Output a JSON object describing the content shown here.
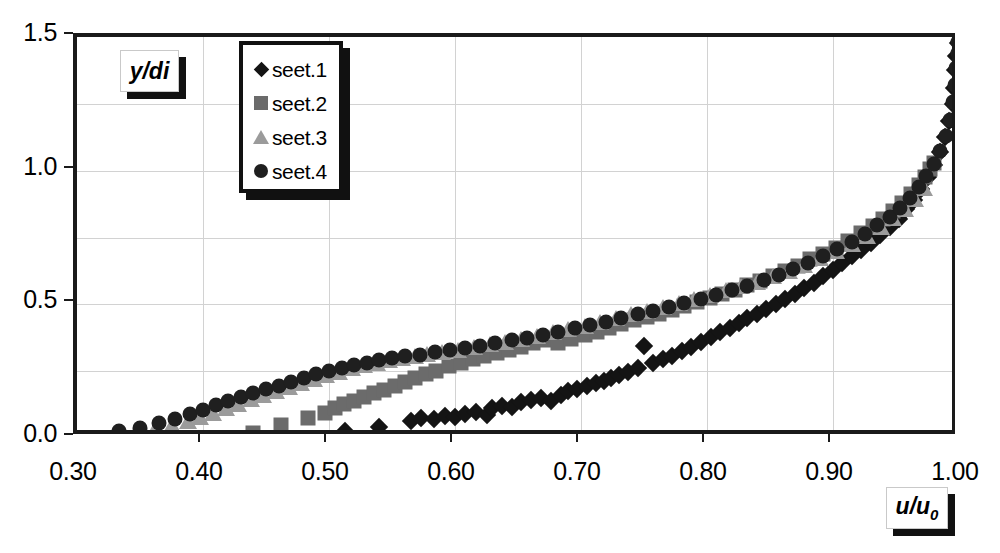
{
  "chart_data": {
    "type": "scatter",
    "title": "",
    "xlabel": "u/u0",
    "ylabel": "y/di",
    "xlim": [
      0.3,
      1.0
    ],
    "ylim": [
      0.0,
      1.5
    ],
    "xticks": [
      "0.30",
      "0.40",
      "0.50",
      "0.60",
      "0.70",
      "0.80",
      "0.90",
      "1.00"
    ],
    "xtick_values": [
      0.3,
      0.4,
      0.5,
      0.6,
      0.7,
      0.8,
      0.9,
      1.0
    ],
    "yticks": [
      "0.0",
      "0.5",
      "1.0",
      "1.5"
    ],
    "ytick_values": [
      0.0,
      0.5,
      1.0,
      1.5
    ],
    "y_minor_gridlines": [
      0.25,
      0.75,
      1.25
    ],
    "grid": true,
    "legend_position": "top-left-inside",
    "series": [
      {
        "name": "seet.1",
        "marker": "diamond",
        "color": "#141414",
        "points": [
          [
            0.513,
            0.025
          ],
          [
            0.54,
            0.04
          ],
          [
            0.565,
            0.065
          ],
          [
            0.573,
            0.073
          ],
          [
            0.583,
            0.07
          ],
          [
            0.592,
            0.082
          ],
          [
            0.6,
            0.078
          ],
          [
            0.608,
            0.09
          ],
          [
            0.617,
            0.098
          ],
          [
            0.625,
            0.085
          ],
          [
            0.629,
            0.112
          ],
          [
            0.637,
            0.12
          ],
          [
            0.645,
            0.115
          ],
          [
            0.652,
            0.133
          ],
          [
            0.66,
            0.142
          ],
          [
            0.668,
            0.15
          ],
          [
            0.676,
            0.14
          ],
          [
            0.684,
            0.162
          ],
          [
            0.69,
            0.175
          ],
          [
            0.697,
            0.185
          ],
          [
            0.705,
            0.195
          ],
          [
            0.712,
            0.205
          ],
          [
            0.718,
            0.215
          ],
          [
            0.724,
            0.225
          ],
          [
            0.73,
            0.235
          ],
          [
            0.737,
            0.248
          ],
          [
            0.745,
            0.262
          ],
          [
            0.75,
            0.345
          ],
          [
            0.757,
            0.28
          ],
          [
            0.765,
            0.295
          ],
          [
            0.772,
            0.308
          ],
          [
            0.78,
            0.325
          ],
          [
            0.787,
            0.34
          ],
          [
            0.795,
            0.36
          ],
          [
            0.803,
            0.378
          ],
          [
            0.81,
            0.395
          ],
          [
            0.818,
            0.412
          ],
          [
            0.825,
            0.43
          ],
          [
            0.832,
            0.448
          ],
          [
            0.84,
            0.465
          ],
          [
            0.847,
            0.483
          ],
          [
            0.855,
            0.5
          ],
          [
            0.862,
            0.52
          ],
          [
            0.87,
            0.54
          ],
          [
            0.877,
            0.56
          ],
          [
            0.885,
            0.58
          ],
          [
            0.892,
            0.605
          ],
          [
            0.9,
            0.63
          ],
          [
            0.907,
            0.655
          ],
          [
            0.915,
            0.68
          ],
          [
            0.922,
            0.705
          ],
          [
            0.93,
            0.73
          ],
          [
            0.937,
            0.76
          ],
          [
            0.945,
            0.79
          ],
          [
            0.952,
            0.82
          ],
          [
            0.958,
            0.855
          ],
          [
            0.964,
            0.89
          ],
          [
            0.97,
            0.93
          ],
          [
            0.975,
            0.975
          ],
          [
            0.98,
            1.02
          ],
          [
            0.985,
            1.07
          ],
          [
            0.989,
            1.125
          ],
          [
            0.992,
            1.185
          ],
          [
            0.995,
            1.25
          ],
          [
            0.996,
            1.31
          ],
          [
            0.997,
            1.375
          ],
          [
            0.998,
            1.43
          ],
          [
            0.999,
            1.478
          ]
        ]
      },
      {
        "name": "seet.2",
        "marker": "square",
        "color": "#6b6b6b",
        "points": [
          [
            0.44,
            0.02
          ],
          [
            0.462,
            0.048
          ],
          [
            0.483,
            0.075
          ],
          [
            0.497,
            0.095
          ],
          [
            0.505,
            0.112
          ],
          [
            0.512,
            0.128
          ],
          [
            0.52,
            0.14
          ],
          [
            0.528,
            0.155
          ],
          [
            0.536,
            0.168
          ],
          [
            0.544,
            0.18
          ],
          [
            0.552,
            0.195
          ],
          [
            0.56,
            0.21
          ],
          [
            0.568,
            0.225
          ],
          [
            0.577,
            0.24
          ],
          [
            0.585,
            0.252
          ],
          [
            0.595,
            0.268
          ],
          [
            0.605,
            0.282
          ],
          [
            0.614,
            0.295
          ],
          [
            0.623,
            0.305
          ],
          [
            0.633,
            0.318
          ],
          [
            0.643,
            0.33
          ],
          [
            0.652,
            0.342
          ],
          [
            0.662,
            0.355
          ],
          [
            0.672,
            0.368
          ],
          [
            0.682,
            0.355
          ],
          [
            0.692,
            0.372
          ],
          [
            0.703,
            0.385
          ],
          [
            0.713,
            0.398
          ],
          [
            0.722,
            0.412
          ],
          [
            0.732,
            0.425
          ],
          [
            0.742,
            0.44
          ],
          [
            0.752,
            0.452
          ],
          [
            0.762,
            0.465
          ],
          [
            0.772,
            0.48
          ],
          [
            0.782,
            0.495
          ],
          [
            0.792,
            0.51
          ],
          [
            0.802,
            0.525
          ],
          [
            0.812,
            0.54
          ],
          [
            0.822,
            0.555
          ],
          [
            0.832,
            0.572
          ],
          [
            0.842,
            0.588
          ],
          [
            0.852,
            0.605
          ],
          [
            0.862,
            0.625
          ],
          [
            0.872,
            0.645
          ],
          [
            0.882,
            0.668
          ],
          [
            0.892,
            0.69
          ],
          [
            0.902,
            0.712
          ],
          [
            0.912,
            0.738
          ],
          [
            0.922,
            0.765
          ],
          [
            0.932,
            0.792
          ],
          [
            0.94,
            0.82
          ],
          [
            0.948,
            0.85
          ],
          [
            0.955,
            0.88
          ],
          [
            0.962,
            0.912
          ],
          [
            0.968,
            0.945
          ],
          [
            0.973,
            0.978
          ],
          [
            0.977,
            1.005
          ],
          [
            0.98,
            1.03
          ]
        ]
      },
      {
        "name": "seet.3",
        "marker": "triangle",
        "color": "#9b9b9b",
        "points": [
          [
            0.348,
            0.022
          ],
          [
            0.362,
            0.035
          ],
          [
            0.375,
            0.048
          ],
          [
            0.388,
            0.062
          ],
          [
            0.398,
            0.078
          ],
          [
            0.408,
            0.095
          ],
          [
            0.418,
            0.112
          ],
          [
            0.428,
            0.128
          ],
          [
            0.438,
            0.145
          ],
          [
            0.448,
            0.16
          ],
          [
            0.458,
            0.175
          ],
          [
            0.468,
            0.19
          ],
          [
            0.478,
            0.205
          ],
          [
            0.488,
            0.22
          ],
          [
            0.498,
            0.235
          ],
          [
            0.508,
            0.248
          ],
          [
            0.518,
            0.262
          ],
          [
            0.528,
            0.272
          ],
          [
            0.538,
            0.282
          ],
          [
            0.548,
            0.292
          ],
          [
            0.558,
            0.3
          ],
          [
            0.568,
            0.308
          ],
          [
            0.578,
            0.315
          ],
          [
            0.59,
            0.322
          ],
          [
            0.602,
            0.33
          ],
          [
            0.615,
            0.34
          ],
          [
            0.628,
            0.35
          ],
          [
            0.64,
            0.36
          ],
          [
            0.652,
            0.37
          ],
          [
            0.665,
            0.382
          ],
          [
            0.678,
            0.395
          ],
          [
            0.69,
            0.408
          ],
          [
            0.703,
            0.42
          ],
          [
            0.715,
            0.435
          ],
          [
            0.728,
            0.448
          ],
          [
            0.74,
            0.462
          ],
          [
            0.752,
            0.475
          ],
          [
            0.765,
            0.49
          ],
          [
            0.778,
            0.505
          ],
          [
            0.79,
            0.52
          ],
          [
            0.802,
            0.535
          ],
          [
            0.815,
            0.552
          ],
          [
            0.827,
            0.568
          ],
          [
            0.84,
            0.585
          ],
          [
            0.852,
            0.605
          ],
          [
            0.865,
            0.625
          ],
          [
            0.877,
            0.648
          ],
          [
            0.89,
            0.672
          ],
          [
            0.902,
            0.698
          ],
          [
            0.915,
            0.725
          ],
          [
            0.927,
            0.755
          ],
          [
            0.938,
            0.788
          ],
          [
            0.948,
            0.822
          ],
          [
            0.957,
            0.858
          ],
          [
            0.965,
            0.895
          ],
          [
            0.972,
            0.935
          ]
        ]
      },
      {
        "name": "seet.4",
        "marker": "circle",
        "color": "#1f1f1f",
        "points": [
          [
            0.333,
            0.025
          ],
          [
            0.35,
            0.038
          ],
          [
            0.365,
            0.055
          ],
          [
            0.378,
            0.072
          ],
          [
            0.39,
            0.09
          ],
          [
            0.4,
            0.105
          ],
          [
            0.41,
            0.122
          ],
          [
            0.42,
            0.138
          ],
          [
            0.43,
            0.152
          ],
          [
            0.44,
            0.168
          ],
          [
            0.45,
            0.182
          ],
          [
            0.46,
            0.196
          ],
          [
            0.47,
            0.21
          ],
          [
            0.48,
            0.224
          ],
          [
            0.49,
            0.238
          ],
          [
            0.5,
            0.25
          ],
          [
            0.51,
            0.262
          ],
          [
            0.52,
            0.272
          ],
          [
            0.53,
            0.282
          ],
          [
            0.54,
            0.29
          ],
          [
            0.55,
            0.298
          ],
          [
            0.56,
            0.305
          ],
          [
            0.572,
            0.312
          ],
          [
            0.584,
            0.32
          ],
          [
            0.596,
            0.328
          ],
          [
            0.608,
            0.336
          ],
          [
            0.62,
            0.345
          ],
          [
            0.632,
            0.355
          ],
          [
            0.645,
            0.365
          ],
          [
            0.657,
            0.375
          ],
          [
            0.67,
            0.387
          ],
          [
            0.682,
            0.398
          ],
          [
            0.695,
            0.41
          ],
          [
            0.707,
            0.422
          ],
          [
            0.72,
            0.435
          ],
          [
            0.732,
            0.448
          ],
          [
            0.745,
            0.462
          ],
          [
            0.757,
            0.476
          ],
          [
            0.77,
            0.49
          ],
          [
            0.782,
            0.505
          ],
          [
            0.795,
            0.52
          ],
          [
            0.807,
            0.536
          ],
          [
            0.82,
            0.552
          ],
          [
            0.832,
            0.57
          ],
          [
            0.845,
            0.59
          ],
          [
            0.857,
            0.61
          ],
          [
            0.868,
            0.632
          ],
          [
            0.88,
            0.655
          ],
          [
            0.892,
            0.68
          ],
          [
            0.903,
            0.706
          ],
          [
            0.915,
            0.734
          ],
          [
            0.925,
            0.764
          ],
          [
            0.935,
            0.795
          ],
          [
            0.945,
            0.828
          ],
          [
            0.953,
            0.862
          ],
          [
            0.961,
            0.898
          ],
          [
            0.968,
            0.938
          ],
          [
            0.974,
            0.98
          ],
          [
            0.98,
            1.025
          ],
          [
            0.985,
            1.075
          ],
          [
            0.99,
            1.13
          ],
          [
            0.993,
            1.19
          ],
          [
            0.995,
            1.255
          ],
          [
            0.997,
            1.32
          ],
          [
            0.998,
            1.385
          ],
          [
            0.999,
            1.44
          ],
          [
            0.999,
            1.48
          ]
        ]
      }
    ]
  },
  "legend": {
    "entries": [
      {
        "label": "seet.1",
        "marker": "diamond"
      },
      {
        "label": "seet.2",
        "marker": "square"
      },
      {
        "label": "seet.3",
        "marker": "triangle"
      },
      {
        "label": "seet.4",
        "marker": "circle"
      }
    ]
  },
  "axis_titles": {
    "y": "y/di",
    "x_main": "u/u",
    "x_sub": "0"
  }
}
